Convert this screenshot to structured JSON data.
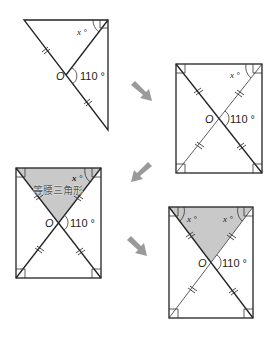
{
  "diagram": {
    "colors": {
      "line": "#222222",
      "arrow": "#9a9a9a",
      "shade": "#c9c9c9",
      "label_text": "#555555"
    },
    "labels": {
      "center": "O",
      "angle_value": "110 °",
      "unknown_angle": "x °",
      "isosceles": "等腰三角形"
    },
    "figures": [
      {
        "id": 1,
        "shape": "right-triangle-with-median",
        "center_label": "O",
        "angle_label": "110 °",
        "x_labels": [
          "x °"
        ]
      },
      {
        "id": 2,
        "shape": "rectangle-with-diagonals",
        "center_label": "O",
        "angle_label": "110 °",
        "x_labels": [
          "x °"
        ]
      },
      {
        "id": 3,
        "shape": "rectangle-with-shaded-top-triangle",
        "center_label": "O",
        "angle_label": "110 °",
        "x_labels": [
          "x °"
        ],
        "shaded_label": "等腰三角形"
      },
      {
        "id": 4,
        "shape": "rectangle-with-shaded-top-triangle",
        "center_label": "O",
        "angle_label": "110 °",
        "x_labels": [
          "x °",
          "x °"
        ]
      }
    ],
    "arrows": [
      {
        "from": 1,
        "to": 2,
        "direction": "down-right"
      },
      {
        "from": 2,
        "to": 3,
        "direction": "down-left"
      },
      {
        "from": 3,
        "to": 4,
        "direction": "down-right"
      }
    ]
  }
}
